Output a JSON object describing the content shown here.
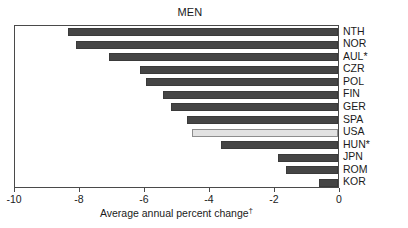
{
  "chart_data": {
    "type": "bar",
    "orientation": "horizontal",
    "title": "MEN",
    "xlabel": "Average annual percent change",
    "xlabel_superscript": "†",
    "ylabel": "",
    "xlim": [
      -10,
      0
    ],
    "xticks": [
      -10,
      -8,
      -6,
      -4,
      -2,
      0
    ],
    "xtick_labels": [
      "-10",
      "-8",
      "-6",
      "-4",
      "-2",
      "0"
    ],
    "grid": false,
    "legend": "none",
    "categories": [
      "NTH",
      "NOR",
      "AUL*",
      "CZR",
      "POL",
      "FIN",
      "GER",
      "SPA",
      "USA",
      "HUN*",
      "JPN",
      "ROM",
      "KOR"
    ],
    "values": [
      -8.3,
      -8.05,
      -7.05,
      -6.1,
      -5.9,
      -5.4,
      -5.15,
      -4.65,
      -4.5,
      -3.6,
      -1.85,
      -1.6,
      -0.6
    ],
    "highlight_category": "USA",
    "colors": {
      "bar": "#454545",
      "bar_highlight": "#e2e2e2",
      "frame": "#4a4a4a",
      "text": "#1a1a1a",
      "background": "#ffffff"
    }
  }
}
